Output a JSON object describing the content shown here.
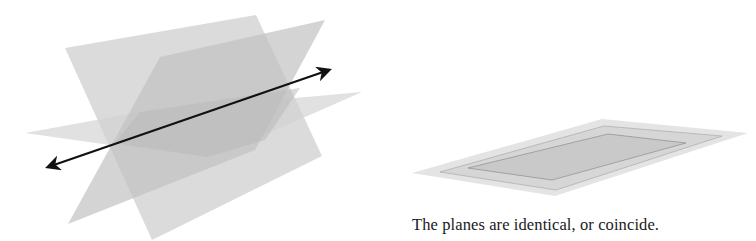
{
  "figures": [
    {
      "id": "left",
      "description": "Three planes intersecting in a common line",
      "colors": {
        "plane_back": "#d6d6d6",
        "plane_front": "#c4c4c4",
        "plane_horizontal": "#dedede",
        "line": "#111111"
      }
    },
    {
      "id": "right",
      "description": "Coincident planes",
      "caption": "The planes are identical, or coincide.",
      "colors": {
        "outer": "#e3e3e3",
        "middle": "#d3d3d3",
        "inner": "#c8c8c8",
        "edge": "#9a9a9a"
      }
    }
  ]
}
